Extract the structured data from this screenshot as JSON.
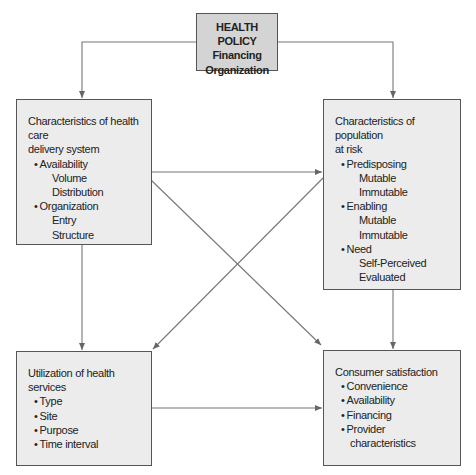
{
  "policy": {
    "title": "HEALTH POLICY",
    "items": [
      "Financing",
      "Organization"
    ]
  },
  "delivery_system": {
    "title_line1": "Characteristics of health care",
    "title_line2": "delivery system",
    "groups": [
      {
        "label": "Availability",
        "subs": [
          "Volume",
          "Distribution"
        ]
      },
      {
        "label": "Organization",
        "subs": [
          "Entry",
          "Structure"
        ]
      }
    ]
  },
  "population": {
    "title_line1": "Characteristics of population",
    "title_line2": "at risk",
    "groups": [
      {
        "label": "Predisposing",
        "subs": [
          "Mutable",
          "Immutable"
        ]
      },
      {
        "label": "Enabling",
        "subs": [
          "Mutable",
          "Immutable"
        ]
      },
      {
        "label": "Need",
        "subs": [
          "Self-Perceived",
          "Evaluated"
        ]
      }
    ]
  },
  "utilization": {
    "title_line1": "Utilization of health",
    "title_line2": "services",
    "items": [
      "Type",
      "Site",
      "Purpose",
      "Time interval"
    ]
  },
  "satisfaction": {
    "title": "Consumer satisfaction",
    "items": [
      "Convenience",
      "Availability",
      "Financing",
      "Provider"
    ],
    "continuation": "characteristics"
  },
  "colors": {
    "policy_fill": "#d4d4d4",
    "box_fill": "#ececec",
    "line": "#666666"
  }
}
